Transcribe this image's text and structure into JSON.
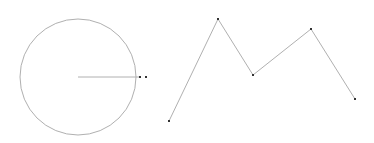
{
  "canvas": {
    "width": 374,
    "height": 143,
    "background": "#ffffff"
  },
  "colors": {
    "stroke": "#b0b0b0",
    "point": "#333333"
  },
  "circle": {
    "cx": 78,
    "cy": 77,
    "r": 58
  },
  "radius_line": {
    "x1": 78,
    "y1": 77,
    "x2": 140,
    "y2": 77
  },
  "radius_points": [
    {
      "x": 140,
      "y": 77
    },
    {
      "x": 146,
      "y": 77
    }
  ],
  "polyline": {
    "points": [
      {
        "x": 169,
        "y": 121
      },
      {
        "x": 218,
        "y": 19
      },
      {
        "x": 253,
        "y": 75
      },
      {
        "x": 311,
        "y": 29
      },
      {
        "x": 355,
        "y": 99
      }
    ]
  }
}
